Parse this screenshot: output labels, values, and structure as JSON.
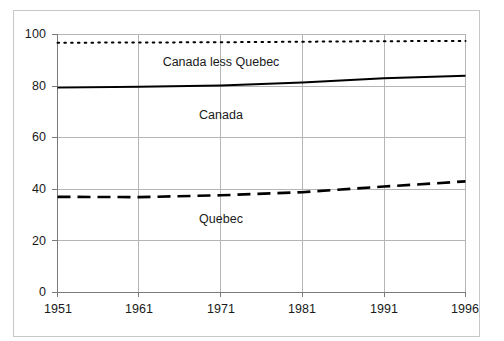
{
  "chart_data": {
    "type": "line",
    "title": "",
    "xlabel": "",
    "ylabel": "",
    "categories": [
      "1951",
      "1961",
      "1971",
      "1981",
      "1991",
      "1996"
    ],
    "xlim": [
      "1951",
      "1996"
    ],
    "ylim": [
      0,
      100
    ],
    "y_ticks": [
      "0",
      "20",
      "40",
      "60",
      "80",
      "100"
    ],
    "grid": "both",
    "legend_position": "inline-annotations",
    "series": [
      {
        "name": "Canada less Quebec",
        "style": "dotted",
        "color": "#000000",
        "values": [
          96.8,
          96.9,
          97.0,
          97.2,
          97.4,
          97.5
        ]
      },
      {
        "name": "Canada",
        "style": "solid",
        "color": "#000000",
        "values": [
          79.4,
          79.7,
          80.2,
          81.4,
          83.0,
          84.0
        ]
      },
      {
        "name": "Quebec",
        "style": "dashed",
        "color": "#000000",
        "values": [
          37.0,
          36.9,
          37.6,
          38.8,
          41.0,
          43.0
        ]
      }
    ],
    "annotations": [
      {
        "text": "Canada less Quebec",
        "x_category": "1971",
        "y": 89
      },
      {
        "text": "Canada",
        "x_category": "1971",
        "y": 71
      },
      {
        "text": "Quebec",
        "x_category": "1971",
        "y": 29
      }
    ]
  },
  "axis": {
    "y_ticks": [
      "100",
      "80",
      "60",
      "40",
      "20",
      "0"
    ],
    "x_ticks": [
      "1951",
      "1961",
      "1971",
      "1981",
      "1991",
      "1996"
    ]
  },
  "labels": {
    "canada_less_quebec": "Canada less Quebec",
    "canada": "Canada",
    "quebec": "Quebec"
  },
  "colors": {
    "series_line": "#000000",
    "gridline": "#b5b5b5",
    "axis": "#7a7a7a",
    "page_border": "#c8c8c8",
    "background": "#ffffff"
  }
}
